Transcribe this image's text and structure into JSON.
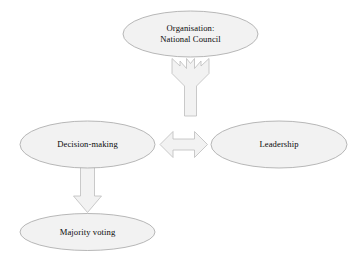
{
  "diagram": {
    "background_color": "#ffffff",
    "node_fill_color": "#f2f2f2",
    "node_border_color": "#a6a6a6",
    "arrow_fill_color": "#f2f2f2",
    "arrow_border_color": "#bdbdbd",
    "text_color": "#0a0a0a",
    "nodes": [
      {
        "id": "organisation",
        "shape": "ellipse",
        "line1": "Organisation:",
        "line2": "National Council",
        "cx": 190.5,
        "cy": 34,
        "rx": 67.5,
        "ry": 23
      },
      {
        "id": "decision-making",
        "shape": "ellipse",
        "line1": "Decision-making",
        "line2": "",
        "cx": 87.5,
        "cy": 144.5,
        "rx": 67.5,
        "ry": 23.5
      },
      {
        "id": "leadership",
        "shape": "ellipse",
        "line1": "Leadership",
        "line2": "",
        "cx": 279,
        "cy": 144.5,
        "rx": 68,
        "ry": 23.5
      },
      {
        "id": "majority-voting",
        "shape": "ellipse",
        "line1": "Majority voting",
        "line2": "",
        "cx": 87.5,
        "cy": 232,
        "rx": 67.5,
        "ry": 18.5
      }
    ],
    "connectors": [
      {
        "id": "forked-arrow",
        "kind": "y-shaped-double-arrow",
        "from": "organisation",
        "to": "decision-making-and-leadership",
        "direction": "up-split"
      },
      {
        "id": "horizontal-double-arrow",
        "kind": "double-headed-arrow",
        "from": "decision-making",
        "to": "leadership",
        "direction": "horizontal"
      },
      {
        "id": "down-arrow",
        "kind": "single-headed-arrow",
        "from": "decision-making",
        "to": "majority-voting",
        "direction": "down"
      }
    ]
  }
}
